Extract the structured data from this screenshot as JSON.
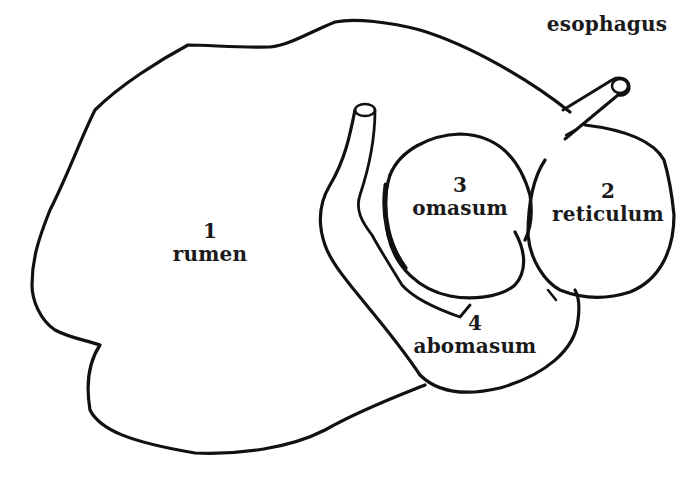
{
  "figure": {
    "type": "anatomical line drawing"
  },
  "labels": {
    "rumen": {
      "number": "1",
      "name": "rumen"
    },
    "reticulum": {
      "number": "2",
      "name": "reticulum"
    },
    "omasum": {
      "number": "3",
      "name": "omasum"
    },
    "abomasum": {
      "number": "4",
      "name": "abomasum"
    },
    "esophagus": {
      "name": "esophagus"
    }
  },
  "colors": {
    "stroke": "#111111",
    "text": "#1a1a1a",
    "background": "#ffffff"
  }
}
